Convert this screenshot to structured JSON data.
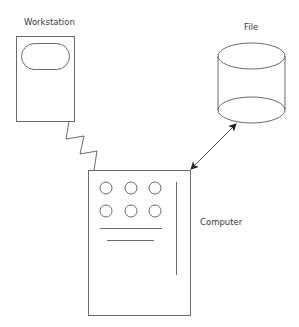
{
  "diagram": {
    "nodes": [
      {
        "id": "workstation",
        "label": "Workstation",
        "shape": "terminal-box"
      },
      {
        "id": "file",
        "label": "File",
        "shape": "cylinder"
      },
      {
        "id": "computer",
        "label": "Computer",
        "shape": "computer-cabinet"
      }
    ],
    "edges": [
      {
        "from": "workstation",
        "to": "computer",
        "style": "zigzag",
        "meaning": "communication link"
      },
      {
        "from": "computer",
        "to": "file",
        "style": "double-arrow"
      }
    ]
  },
  "labels": {
    "workstation": "Workstation",
    "file": "File",
    "computer": "Computer"
  },
  "colors": {
    "stroke": "#6a6a6a",
    "text": "#3a3a3a",
    "background": "#ffffff"
  }
}
